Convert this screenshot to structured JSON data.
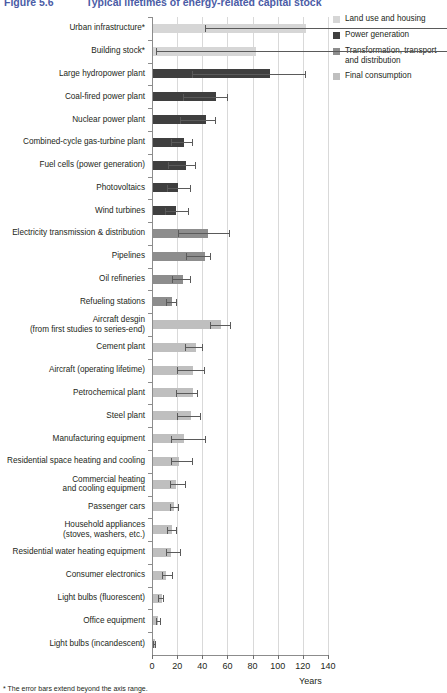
{
  "title": {
    "figure_number": "Figure 5.6",
    "text": "Typical lifetimes of energy-related capital stock",
    "color": "#4b5ca6"
  },
  "legend": {
    "position": "top-right",
    "items": [
      {
        "label": "Land use and housing",
        "color": "#d6d6d6",
        "key": "land_use"
      },
      {
        "label": "Power generation",
        "color": "#3f3f3f",
        "key": "power_generation"
      },
      {
        "label": "Transformation, transport\nand distribution",
        "color": "#8d8d8d",
        "key": "transformation"
      },
      {
        "label": "Final consumption",
        "color": "#bfbfbf",
        "key": "final_consumption"
      }
    ]
  },
  "axis": {
    "xlabel": "Years",
    "ticks": [
      0,
      20,
      40,
      60,
      80,
      100,
      120,
      140
    ],
    "xlim": [
      0,
      140
    ],
    "grid": true
  },
  "footnote": "* The error bars extend beyond the axis range.",
  "chart_data": {
    "type": "bar",
    "orientation": "horizontal",
    "title": "Typical lifetimes of energy-related capital stock",
    "xlabel": "Years",
    "ylabel": "",
    "xlim": [
      0,
      140
    ],
    "grid": true,
    "legend_position": "top-right",
    "categories": [
      "Urban infrastructure*",
      "Building stock*",
      "Large hydropower plant",
      "Coal-fired power plant",
      "Nuclear power plant",
      "Combined-cycle gas-turbine plant",
      "Fuel cells (power generation)",
      "Photovoltaics",
      "Wind turbines",
      "Electricity transmission & distribution",
      "Pipelines",
      "Oil refineries",
      "Refueling stations",
      "Aircraft desgin\n(from first studies to series-end)",
      "Cement plant",
      "Aircraft (operating lifetime)",
      "Petrochemical plant",
      "Steel plant",
      "Manufacturing equipment",
      "Residential space heating and cooling",
      "Commercial heating\nand cooling equipment",
      "Passenger cars",
      "Household appliances\n(stoves, washers, etc.)",
      "Residential water heating equipment",
      "Consumer electronics",
      "Light bulbs (fluorescent)",
      "Office equipment",
      "Light bulbs (incandescent)"
    ],
    "values": [
      122,
      82,
      93,
      50,
      42,
      25,
      26,
      20,
      18,
      44,
      41,
      24,
      15,
      54,
      34,
      32,
      32,
      30,
      25,
      21,
      18,
      17,
      15,
      14,
      10,
      7,
      4,
      1.5
    ],
    "err_low": [
      42,
      3,
      32,
      25,
      22,
      15,
      13,
      12,
      10,
      21,
      27,
      16,
      11,
      46,
      26,
      20,
      19,
      20,
      15,
      15,
      14,
      14,
      12,
      11,
      8,
      5,
      3,
      1
    ],
    "err_high": [
      300,
      300,
      122,
      60,
      50,
      32,
      34,
      30,
      29,
      61,
      46,
      30,
      19,
      62,
      40,
      41,
      36,
      38,
      42,
      32,
      26,
      21,
      19,
      22,
      16,
      9,
      6,
      2
    ],
    "group": [
      "land_use",
      "land_use",
      "power_generation",
      "power_generation",
      "power_generation",
      "power_generation",
      "power_generation",
      "power_generation",
      "power_generation",
      "transformation",
      "transformation",
      "transformation",
      "transformation",
      "final_consumption",
      "final_consumption",
      "final_consumption",
      "final_consumption",
      "final_consumption",
      "final_consumption",
      "final_consumption",
      "final_consumption",
      "final_consumption",
      "final_consumption",
      "final_consumption",
      "final_consumption",
      "final_consumption",
      "final_consumption",
      "final_consumption"
    ],
    "group_colors": {
      "land_use": "#d6d6d6",
      "power_generation": "#3f3f3f",
      "transformation": "#8d8d8d",
      "final_consumption": "#bfbfbf"
    }
  }
}
